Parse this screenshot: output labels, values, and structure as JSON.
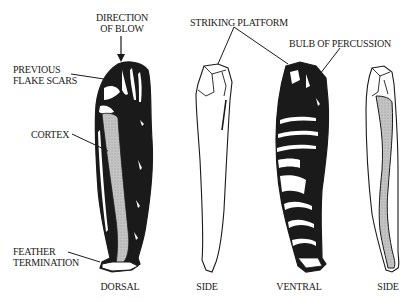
{
  "diagram": {
    "labels": {
      "direction_of_blow_1": "DIRECTION",
      "direction_of_blow_2": "OF BLOW",
      "previous_flake_scars_1": "PREVIOUS",
      "previous_flake_scars_2": "FLAKE SCARS",
      "cortex": "CORTEX",
      "feather_termination_1": "FEATHER",
      "feather_termination_2": "TERMINATION",
      "striking_platform": "STRIKING PLATFORM",
      "bulb_of_percussion": "BULB OF PERCUSSION"
    },
    "views": [
      {
        "id": "dorsal",
        "caption": "DORSAL"
      },
      {
        "id": "side-1",
        "caption": "SIDE"
      },
      {
        "id": "ventral",
        "caption": "VENTRAL"
      },
      {
        "id": "side-2",
        "caption": "SIDE"
      }
    ],
    "colors": {
      "ink": "#1a1a1a",
      "cortex_fill": "#bdbdbd",
      "background": "#ffffff"
    }
  }
}
